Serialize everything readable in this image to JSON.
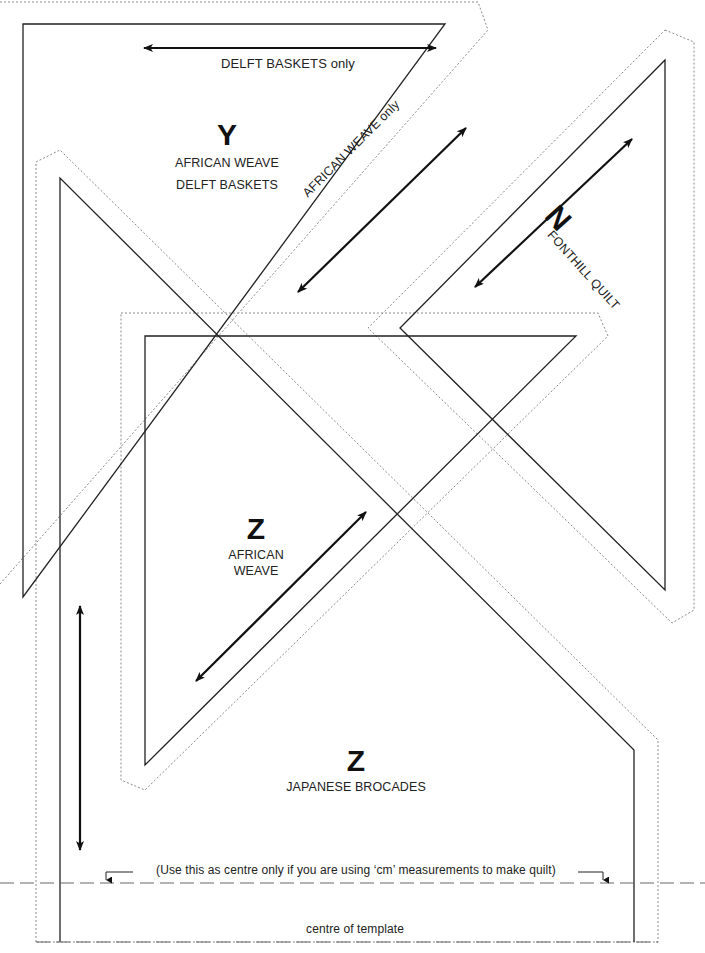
{
  "diagram": {
    "type": "quilt-template",
    "colors": {
      "cut_line": "#222222",
      "seam_line": "#888888",
      "arrow": "#111111",
      "background": "#ffffff"
    }
  },
  "pieces": {
    "y": {
      "letter": "Y",
      "fabrics": [
        "AFRICAN WEAVE",
        "DELFT BASKETS"
      ],
      "grain_label_top": "DELFT BASKETS only",
      "grain_label_diagonal": "AFRICAN WEAVE only"
    },
    "n": {
      "letter": "N",
      "fabric": "FONTHILL QUILT"
    },
    "z_triangle": {
      "letter": "Z",
      "fabric_line1": "AFRICAN",
      "fabric_line2": "WEAVE"
    },
    "z_large": {
      "letter": "Z",
      "fabric": "JAPANESE BROCADES"
    }
  },
  "annotations": {
    "cm_note": "(Use this as centre only if you are using ‘cm’ measurements to make quilt)",
    "centre_label": "centre of template"
  }
}
